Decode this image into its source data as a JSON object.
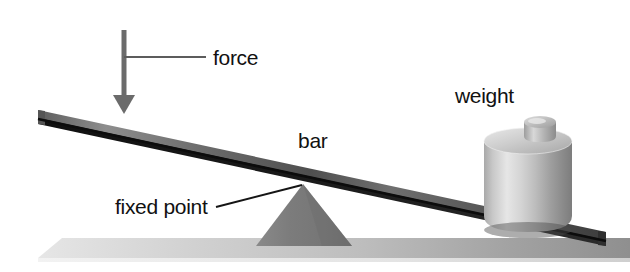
{
  "figure": {
    "type": "lever-diagram",
    "background_color": "#ffffff"
  },
  "labels": {
    "force": "force",
    "bar": "bar",
    "fixed_point": "fixed point",
    "weight": "weight"
  },
  "colors": {
    "background": "#ffffff",
    "bar_top_light": "#8c8c8c",
    "bar_top_dark": "#3a3a3a",
    "bar_edge": "#111111",
    "fulcrum": "#7e7e7e",
    "fulcrum_dark": "#6e6e6e",
    "ground_light": "#d8d8d8",
    "ground_dark": "#9a9a9a",
    "weight_body_light": "#e2e2e2",
    "weight_body_dark": "#8a8a8a",
    "weight_top": "#cfcfcf",
    "arrow": "#6b6b6b",
    "leader_line": "#1a1a1a",
    "text": "#111111"
  },
  "geometry": {
    "bar": {
      "left_end_x": 38,
      "left_end_y": 110,
      "right_end_x": 606,
      "right_end_y": 232,
      "thickness_px": 14,
      "description": "tilted plank sloping down to the right"
    },
    "fulcrum": {
      "apex_x": 303,
      "apex_y": 184,
      "base_left_x": 258,
      "base_right_x": 350,
      "base_y": 245,
      "shape": "triangle"
    },
    "ground": {
      "top_y": 238,
      "bottom_y": 258,
      "left_x": 38,
      "right_x": 630,
      "shape": "parallelogram slab"
    },
    "force_arrow": {
      "shaft_x": 124,
      "top_y": 30,
      "tip_y": 113,
      "head_half_width": 9,
      "direction": "down"
    },
    "force_leader": {
      "x1": 124,
      "y1": 57,
      "x2": 206,
      "y2": 57
    },
    "fixed_point_leader": {
      "x1": 216,
      "y1": 207,
      "x2": 302,
      "y2": 185
    },
    "weight": {
      "center_x": 528,
      "body_top_y": 132,
      "body_bottom_y": 228,
      "radius_x": 44,
      "knob_center_x": 538,
      "knob_top_y": 112
    }
  },
  "label_positions": {
    "force": {
      "x": 213,
      "y": 65
    },
    "bar": {
      "x": 298,
      "y": 148
    },
    "fixed_point": {
      "x": 115,
      "y": 214
    },
    "weight": {
      "x": 455,
      "y": 103
    }
  }
}
